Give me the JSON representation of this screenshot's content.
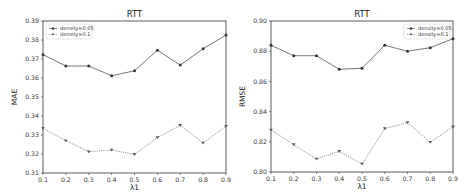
{
  "chart_data": [
    {
      "type": "line",
      "title": "RTT",
      "xlabel": "λ1",
      "ylabel": "MAE",
      "x": [
        0.1,
        0.2,
        0.3,
        0.4,
        0.5,
        0.6,
        0.7,
        0.8,
        0.9
      ],
      "xticks": [
        "0.1",
        "0.2",
        "0.3",
        "0.4",
        "0.5",
        "0.6",
        "0.7",
        "0.8",
        "0.9"
      ],
      "xlim": [
        0.1,
        0.9
      ],
      "ylim": [
        0.31,
        0.39
      ],
      "yticks": [
        "0.31",
        "0.32",
        "0.33",
        "0.34",
        "0.35",
        "0.36",
        "0.37",
        "0.38",
        "0.39"
      ],
      "grid": false,
      "legend": "top-left",
      "series": [
        {
          "name": "density=0.05",
          "marker": "circle",
          "linestyle": "solid",
          "color": "#555555",
          "values": [
            0.3723,
            0.3663,
            0.3663,
            0.3612,
            0.3638,
            0.3746,
            0.3668,
            0.3754,
            0.3826
          ]
        },
        {
          "name": "density=0.1",
          "marker": "triangle-down",
          "linestyle": "dotted",
          "color": "#777777",
          "values": [
            0.3335,
            0.327,
            0.3212,
            0.3221,
            0.3198,
            0.3286,
            0.3351,
            0.3258,
            0.3346
          ]
        }
      ]
    },
    {
      "type": "line",
      "title": "RTT",
      "xlabel": "λ1",
      "ylabel": "RMSE",
      "x": [
        0.1,
        0.2,
        0.3,
        0.4,
        0.5,
        0.6,
        0.7,
        0.8,
        0.9
      ],
      "xticks": [
        "0.1",
        "0.2",
        "0.3",
        "0.4",
        "0.5",
        "0.6",
        "0.7",
        "0.8",
        "0.9"
      ],
      "xlim": [
        0.1,
        0.9
      ],
      "ylim": [
        0.8,
        0.9
      ],
      "yticks": [
        "0.80",
        "0.82",
        "0.84",
        "0.86",
        "0.88",
        "0.90"
      ],
      "grid": false,
      "legend": "top-right",
      "series": [
        {
          "name": "density=0.05",
          "marker": "circle",
          "linestyle": "solid",
          "color": "#555555",
          "values": [
            0.8839,
            0.877,
            0.877,
            0.868,
            0.8687,
            0.8839,
            0.88,
            0.8823,
            0.8883
          ]
        },
        {
          "name": "density=0.1",
          "marker": "triangle-down",
          "linestyle": "dotted",
          "color": "#777777",
          "values": [
            0.8278,
            0.8181,
            0.8086,
            0.8137,
            0.8053,
            0.8287,
            0.8327,
            0.8197,
            0.83
          ]
        }
      ]
    }
  ]
}
